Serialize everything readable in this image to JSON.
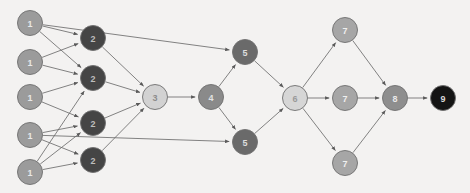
{
  "diagram": {
    "background_color": "#f3f2f1",
    "edge_color": "#6d6d6d",
    "node_stroke_color": "#6e6e6e",
    "width": 470,
    "height": 193,
    "nodes": [
      {
        "id": "n1a",
        "label": "1",
        "x": 30,
        "y": 23,
        "r": 12.5,
        "fill": "#9b9b9b",
        "text_color": "#e8e8e8",
        "layer": 1
      },
      {
        "id": "n1b",
        "label": "1",
        "x": 30,
        "y": 62,
        "r": 12.5,
        "fill": "#9b9b9b",
        "text_color": "#e8e8e8",
        "layer": 1
      },
      {
        "id": "n1c",
        "label": "1",
        "x": 30,
        "y": 97,
        "r": 12.5,
        "fill": "#9b9b9b",
        "text_color": "#e8e8e8",
        "layer": 1
      },
      {
        "id": "n1d",
        "label": "1",
        "x": 30,
        "y": 135,
        "r": 12.5,
        "fill": "#9b9b9b",
        "text_color": "#e8e8e8",
        "layer": 1
      },
      {
        "id": "n1e",
        "label": "1",
        "x": 30,
        "y": 172,
        "r": 12.5,
        "fill": "#9b9b9b",
        "text_color": "#e8e8e8",
        "layer": 1
      },
      {
        "id": "n2a",
        "label": "2",
        "x": 93,
        "y": 38,
        "r": 12.5,
        "fill": "#454545",
        "text_color": "#bdbdbd",
        "layer": 2
      },
      {
        "id": "n2b",
        "label": "2",
        "x": 93,
        "y": 78,
        "r": 12.5,
        "fill": "#454545",
        "text_color": "#bdbdbd",
        "layer": 2
      },
      {
        "id": "n2c",
        "label": "2",
        "x": 93,
        "y": 123,
        "r": 12.5,
        "fill": "#454545",
        "text_color": "#bdbdbd",
        "layer": 2
      },
      {
        "id": "n2d",
        "label": "2",
        "x": 93,
        "y": 160,
        "r": 12.5,
        "fill": "#454545",
        "text_color": "#bdbdbd",
        "layer": 2
      },
      {
        "id": "n3",
        "label": "3",
        "x": 155,
        "y": 97,
        "r": 12.5,
        "fill": "#d2d2d2",
        "text_color": "#8c8c8c",
        "layer": 3
      },
      {
        "id": "n4",
        "label": "4",
        "x": 211,
        "y": 97,
        "r": 12.5,
        "fill": "#8a8a8a",
        "text_color": "#e2e2e2",
        "layer": 4
      },
      {
        "id": "n5a",
        "label": "5",
        "x": 245,
        "y": 52,
        "r": 12.5,
        "fill": "#6a6a6a",
        "text_color": "#dedede",
        "layer": 5
      },
      {
        "id": "n5b",
        "label": "5",
        "x": 245,
        "y": 142,
        "r": 12.5,
        "fill": "#6a6a6a",
        "text_color": "#dedede",
        "layer": 5
      },
      {
        "id": "n6",
        "label": "6",
        "x": 295,
        "y": 98,
        "r": 12.5,
        "fill": "#d6d6d6",
        "text_color": "#9a9a9a",
        "layer": 6
      },
      {
        "id": "n7a",
        "label": "7",
        "x": 345,
        "y": 30,
        "r": 12.5,
        "fill": "#a6a6a6",
        "text_color": "#efefef",
        "layer": 7
      },
      {
        "id": "n7b",
        "label": "7",
        "x": 345,
        "y": 98,
        "r": 12.5,
        "fill": "#a6a6a6",
        "text_color": "#efefef",
        "layer": 7
      },
      {
        "id": "n7c",
        "label": "7",
        "x": 345,
        "y": 163,
        "r": 12.5,
        "fill": "#a6a6a6",
        "text_color": "#efefef",
        "layer": 7
      },
      {
        "id": "n8",
        "label": "8",
        "x": 395,
        "y": 98,
        "r": 12.5,
        "fill": "#8e8e8e",
        "text_color": "#e8e8e8",
        "layer": 8
      },
      {
        "id": "n9",
        "label": "9",
        "x": 443,
        "y": 98,
        "r": 12.5,
        "fill": "#141414",
        "text_color": "#d8d8d8",
        "layer": 9
      }
    ],
    "edges": [
      {
        "from": "n1a",
        "to": "n2a"
      },
      {
        "from": "n1a",
        "to": "n2b"
      },
      {
        "from": "n1a",
        "to": "n5a"
      },
      {
        "from": "n1b",
        "to": "n2a"
      },
      {
        "from": "n1b",
        "to": "n2b"
      },
      {
        "from": "n1c",
        "to": "n2b"
      },
      {
        "from": "n1c",
        "to": "n2c"
      },
      {
        "from": "n1d",
        "to": "n2c"
      },
      {
        "from": "n1d",
        "to": "n2d"
      },
      {
        "from": "n1d",
        "to": "n5b"
      },
      {
        "from": "n1e",
        "to": "n2b"
      },
      {
        "from": "n1e",
        "to": "n2c"
      },
      {
        "from": "n1e",
        "to": "n2d"
      },
      {
        "from": "n2a",
        "to": "n3"
      },
      {
        "from": "n2b",
        "to": "n3"
      },
      {
        "from": "n2c",
        "to": "n3"
      },
      {
        "from": "n2d",
        "to": "n3"
      },
      {
        "from": "n3",
        "to": "n4"
      },
      {
        "from": "n4",
        "to": "n5a"
      },
      {
        "from": "n4",
        "to": "n5b"
      },
      {
        "from": "n5a",
        "to": "n6"
      },
      {
        "from": "n5b",
        "to": "n6"
      },
      {
        "from": "n6",
        "to": "n7a"
      },
      {
        "from": "n6",
        "to": "n7b"
      },
      {
        "from": "n6",
        "to": "n7c"
      },
      {
        "from": "n7a",
        "to": "n8"
      },
      {
        "from": "n7b",
        "to": "n8"
      },
      {
        "from": "n7c",
        "to": "n8"
      },
      {
        "from": "n8",
        "to": "n9"
      }
    ]
  }
}
